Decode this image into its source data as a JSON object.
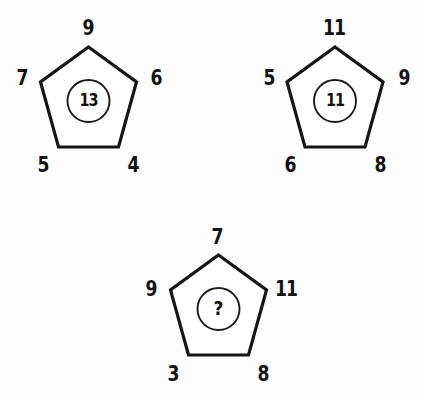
{
  "puzzle": {
    "type": "pentagon-number-puzzle",
    "background_color": "#fdfdfd",
    "ink_color": "#151515",
    "unknown_marker": "?",
    "figures": [
      {
        "id": "pentagon-1",
        "position": "top-left",
        "vertices": {
          "top": "9",
          "upper_left": "7",
          "upper_right": "6",
          "lower_left": "5",
          "lower_right": "4"
        },
        "center": "13"
      },
      {
        "id": "pentagon-2",
        "position": "top-right",
        "vertices": {
          "top": "11",
          "upper_left": "5",
          "upper_right": "9",
          "lower_left": "6",
          "lower_right": "8"
        },
        "center": "11"
      },
      {
        "id": "pentagon-3",
        "position": "bottom-center",
        "vertices": {
          "top": "7",
          "upper_left": "9",
          "upper_right": "11",
          "lower_left": "3",
          "lower_right": "8"
        },
        "center": "?"
      }
    ]
  }
}
